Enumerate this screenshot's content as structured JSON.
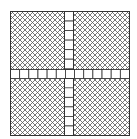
{
  "figure": {
    "quadrants": [
      {
        "name": "top-left",
        "fill": "crosshatch"
      },
      {
        "name": "top-right",
        "fill": "crosshatch"
      },
      {
        "name": "bottom-left",
        "fill": "crosshatch"
      },
      {
        "name": "bottom-right",
        "fill": "crosshatch"
      }
    ],
    "cross": {
      "horizontal_cells": 13,
      "vertical_cells": 13,
      "cell_fill": "blank"
    },
    "colors": {
      "line": "#333333",
      "hatch": "#555555",
      "background": "#ffffff"
    }
  }
}
